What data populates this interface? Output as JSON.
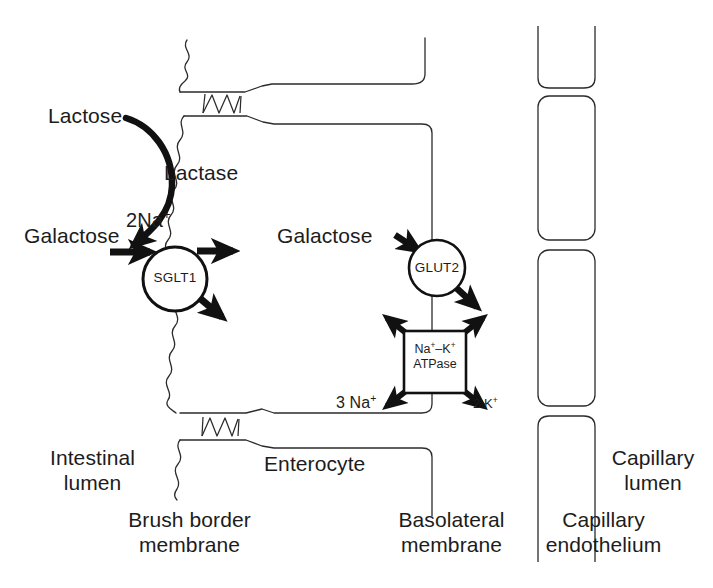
{
  "figure": {
    "line_color": "#2b2b2b",
    "arrow_color": "#111111",
    "background": "#ffffff"
  },
  "labels": {
    "lactose": "Lactose",
    "lactase": "Lactase",
    "galactose_lumen": "Galactose",
    "galactose_cell": "Galactose",
    "two_na": "2Na",
    "two_na_charge": "+",
    "three_na": "3 Na",
    "three_na_charge": "+",
    "two_k": "2 K",
    "two_k_charge": "+",
    "intestinal_lumen": "Intestinal\nlumen",
    "intestinal_lumen_line1": "Intestinal",
    "intestinal_lumen_line2": "lumen",
    "enterocyte": "Enterocyte",
    "brush_border_line1": "Brush border",
    "brush_border_line2": "membrane",
    "basolateral_line1": "Basolateral",
    "basolateral_line2": "membrane",
    "capillary_endothelium_line1": "Capillary",
    "capillary_endothelium_line2": "endothelium",
    "capillary_lumen_line1": "Capillary",
    "capillary_lumen_line2": "lumen"
  },
  "transporters": [
    {
      "id": "sglt1",
      "name": "SGLT1",
      "shape": "circle",
      "cx": 175,
      "cy": 279,
      "r": 32,
      "substrates_in": [
        "2Na+",
        "Galactose"
      ],
      "substrates_out": [
        "Galactose",
        "Na+"
      ]
    },
    {
      "id": "glut2",
      "name": "GLUT2",
      "shape": "circle",
      "cx": 437,
      "cy": 268,
      "r": 28,
      "substrates_in": [
        "Galactose"
      ],
      "substrates_out": [
        "Galactose"
      ]
    },
    {
      "id": "na-k-atpase",
      "name_line1": "Na⁻–K⁺",
      "name_line1_a": "Na",
      "name_line1_b": "–K",
      "name_line2": "ATPase",
      "shape": "square",
      "x": 404,
      "y": 331,
      "w": 62,
      "h": 62
    }
  ],
  "compartments": [
    {
      "id": "intestinal-lumen",
      "label": "Intestinal lumen",
      "side": "left"
    },
    {
      "id": "enterocyte",
      "label": "Enterocyte",
      "side": "center"
    },
    {
      "id": "capillary-lumen",
      "label": "Capillary lumen",
      "side": "right"
    }
  ],
  "membranes": [
    {
      "id": "brush-border-membrane",
      "label": "Brush border membrane",
      "style": "wavy"
    },
    {
      "id": "basolateral-membrane",
      "label": "Basolateral membrane",
      "style": "straight"
    }
  ],
  "endothelial_cells": [
    {
      "id": "endothelial-cell-top",
      "x": 537,
      "y": 36,
      "w": 58,
      "h": 52
    },
    {
      "id": "endothelial-cell-middle",
      "x": 537,
      "y": 92,
      "w": 58,
      "h": 148
    },
    {
      "id": "endothelial-cell-lower",
      "x": 537,
      "y": 246,
      "w": 58,
      "h": 158
    },
    {
      "id": "endothelial-cell-bottom",
      "x": 537,
      "y": 412,
      "w": 58,
      "h": 115
    }
  ]
}
